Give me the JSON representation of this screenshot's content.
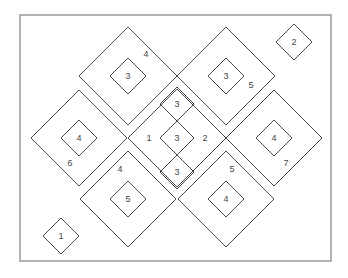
{
  "frame": {
    "x": 20,
    "y": 15,
    "w": 311,
    "h": 246
  },
  "diamonds": [
    {
      "cx": 128,
      "cy": 76,
      "r": 49,
      "label": "4",
      "lx": 146,
      "ly": 57
    },
    {
      "cx": 128,
      "cy": 76,
      "r": 18,
      "label": "3",
      "lx": 128,
      "ly": 79
    },
    {
      "cx": 226,
      "cy": 76,
      "r": 49,
      "label": "5",
      "lx": 251,
      "ly": 88
    },
    {
      "cx": 226,
      "cy": 76,
      "r": 18,
      "label": "3",
      "lx": 226,
      "ly": 79
    },
    {
      "cx": 294,
      "cy": 42,
      "r": 18,
      "label": "2",
      "lx": 294,
      "ly": 45
    },
    {
      "cx": 79,
      "cy": 138,
      "r": 48,
      "label": "6",
      "lx": 70,
      "ly": 166
    },
    {
      "cx": 79,
      "cy": 138,
      "r": 18,
      "label": "4",
      "lx": 79,
      "ly": 141
    },
    {
      "cx": 274,
      "cy": 138,
      "r": 48,
      "label": "7",
      "lx": 286,
      "ly": 166
    },
    {
      "cx": 274,
      "cy": 138,
      "r": 18,
      "label": "4",
      "lx": 274,
      "ly": 141
    },
    {
      "cx": 128,
      "cy": 199,
      "r": 48,
      "label": "4",
      "lx": 120,
      "ly": 172
    },
    {
      "cx": 128,
      "cy": 199,
      "r": 18,
      "label": "5",
      "lx": 128,
      "ly": 202
    },
    {
      "cx": 226,
      "cy": 199,
      "r": 48,
      "label": "5",
      "lx": 232,
      "ly": 172
    },
    {
      "cx": 226,
      "cy": 199,
      "r": 18,
      "label": "4",
      "lx": 226,
      "ly": 202
    },
    {
      "cx": 61,
      "cy": 236,
      "r": 18,
      "label": "1",
      "lx": 61,
      "ly": 239
    },
    {
      "cx": 177,
      "cy": 138,
      "r": 49,
      "label": "",
      "lx": 0,
      "ly": 0
    },
    {
      "cx": 177,
      "cy": 138,
      "r": 17,
      "label": "3",
      "lx": 177,
      "ly": 141
    },
    {
      "cx": 177,
      "cy": 104,
      "r": 17,
      "label": "3",
      "lx": 177,
      "ly": 107
    },
    {
      "cx": 177,
      "cy": 172,
      "r": 17,
      "label": "3",
      "lx": 177,
      "ly": 175
    }
  ],
  "labels": [
    {
      "text": "1",
      "x": 149,
      "y": 141
    },
    {
      "text": "2",
      "x": 205,
      "y": 141
    }
  ]
}
